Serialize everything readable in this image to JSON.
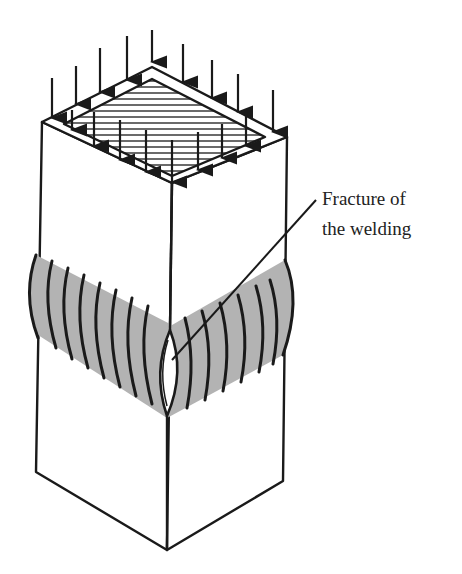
{
  "diagram": {
    "annotation": {
      "line1": "Fracture of",
      "line2": "the welding"
    },
    "colors": {
      "stroke": "#1a1a1a",
      "bulge_fill": "#b3b3b3",
      "background": "#ffffff"
    },
    "load_arrows": 16
  }
}
